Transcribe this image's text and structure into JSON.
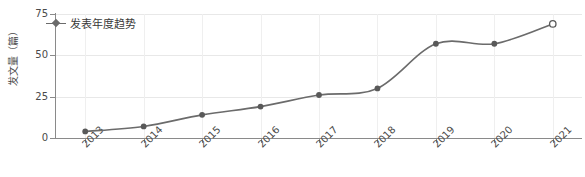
{
  "chart_data": {
    "type": "line",
    "title": "",
    "xlabel": "",
    "ylabel": "发文量（篇）",
    "categories": [
      "2013",
      "2014",
      "2015",
      "2016",
      "2017",
      "2018",
      "2019",
      "2020",
      "2021"
    ],
    "values": [
      4,
      7,
      14,
      19,
      26,
      30,
      57,
      57,
      69
    ],
    "series": [
      {
        "name": "发表年度趋势",
        "values": [
          4,
          7,
          14,
          19,
          26,
          30,
          57,
          57,
          69
        ]
      }
    ],
    "ylim": [
      0,
      75
    ],
    "yticks": [
      0,
      25,
      50,
      75
    ],
    "ytick_labels": [
      "0",
      "25",
      "50",
      "75"
    ],
    "grid": true,
    "legend_position": "top-left",
    "line_color": "#6b6b6b",
    "marker_color": "#595959",
    "marker_shape": "circle",
    "last_point_hollow": true,
    "xtick_rotation": -45,
    "smoothing": "spline"
  },
  "legend": {
    "entries": [
      {
        "label": "发表年度趋势",
        "marker": "diamond-line-marker"
      }
    ]
  },
  "axes": {
    "y_title": "发文量（篇）",
    "y_labels": [
      "75",
      "50",
      "25",
      "0"
    ],
    "x_labels": [
      "2013",
      "2014",
      "2015",
      "2016",
      "2017",
      "2018",
      "2019",
      "2020",
      "2021"
    ]
  },
  "colors": {
    "line": "#6b6b6b",
    "marker": "#595959",
    "axis": "#8a8a8a",
    "grid": "#e8e8e8",
    "text": "#4a4a4a",
    "background": "#ffffff"
  }
}
